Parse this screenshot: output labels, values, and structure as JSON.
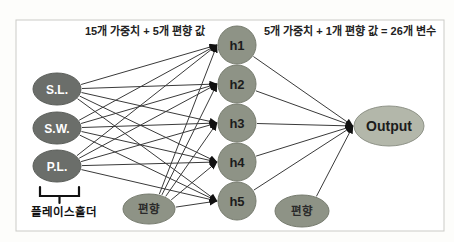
{
  "diagram": {
    "annotations": {
      "hidden_layer_note": "15개 가중치 + 5개 편향 값",
      "output_layer_note": "5개 가중치 + 1개 편향 값 = 26개 변수",
      "placeholder_label": "플레이스홀더"
    },
    "colors": {
      "input_fill": "#6b6e6a",
      "input_stroke": "#5b5e5a",
      "hidden_fill": "#8e9386",
      "hidden_stroke": "#767b6e",
      "bias_fill": "#8e9386",
      "bias_stroke": "#767b6e",
      "output_fill": "#b3b7aa",
      "output_stroke": "#8f9388",
      "edge": "#3a3a3a",
      "arrowhead": "#111111",
      "frame_border": "#cbcbc7"
    },
    "nodes": [
      {
        "id": "sl",
        "label": "S.L.",
        "type": "input",
        "x": 57,
        "y": 89,
        "rx": 24,
        "ry": 16
      },
      {
        "id": "sw",
        "label": "S.W.",
        "type": "input",
        "x": 57,
        "y": 128,
        "rx": 24,
        "ry": 16
      },
      {
        "id": "pl",
        "label": "P.L.",
        "type": "input",
        "x": 57,
        "y": 166,
        "rx": 24,
        "ry": 16
      },
      {
        "id": "h1",
        "label": "h1",
        "type": "hidden",
        "x": 237,
        "y": 45,
        "rx": 19,
        "ry": 19
      },
      {
        "id": "h2",
        "label": "h2",
        "type": "hidden",
        "x": 237,
        "y": 84,
        "rx": 19,
        "ry": 19
      },
      {
        "id": "h3",
        "label": "h3",
        "type": "hidden",
        "x": 237,
        "y": 123,
        "rx": 19,
        "ry": 19
      },
      {
        "id": "h4",
        "label": "h4",
        "type": "hidden",
        "x": 237,
        "y": 162,
        "rx": 19,
        "ry": 19
      },
      {
        "id": "h5",
        "label": "h5",
        "type": "hidden",
        "x": 237,
        "y": 201,
        "rx": 19,
        "ry": 19
      },
      {
        "id": "bias1",
        "label": "편향",
        "type": "bias",
        "x": 149,
        "y": 209,
        "rx": 26,
        "ry": 15
      },
      {
        "id": "bias2",
        "label": "편향",
        "type": "bias",
        "x": 302,
        "y": 211,
        "rx": 27,
        "ry": 16
      },
      {
        "id": "output",
        "label": "Output",
        "type": "output",
        "x": 389,
        "y": 126,
        "rx": 35,
        "ry": 20
      }
    ],
    "edges": [
      {
        "from": "sl",
        "to": "h1"
      },
      {
        "from": "sl",
        "to": "h2"
      },
      {
        "from": "sl",
        "to": "h3"
      },
      {
        "from": "sl",
        "to": "h4"
      },
      {
        "from": "sl",
        "to": "h5"
      },
      {
        "from": "sw",
        "to": "h1"
      },
      {
        "from": "sw",
        "to": "h2"
      },
      {
        "from": "sw",
        "to": "h3"
      },
      {
        "from": "sw",
        "to": "h4"
      },
      {
        "from": "sw",
        "to": "h5"
      },
      {
        "from": "pl",
        "to": "h1"
      },
      {
        "from": "pl",
        "to": "h2"
      },
      {
        "from": "pl",
        "to": "h3"
      },
      {
        "from": "pl",
        "to": "h4"
      },
      {
        "from": "pl",
        "to": "h5"
      },
      {
        "from": "bias1",
        "to": "h1"
      },
      {
        "from": "bias1",
        "to": "h2"
      },
      {
        "from": "bias1",
        "to": "h3"
      },
      {
        "from": "bias1",
        "to": "h4"
      },
      {
        "from": "bias1",
        "to": "h5"
      },
      {
        "from": "h1",
        "to": "output"
      },
      {
        "from": "h2",
        "to": "output"
      },
      {
        "from": "h3",
        "to": "output"
      },
      {
        "from": "h4",
        "to": "output"
      },
      {
        "from": "h5",
        "to": "output"
      },
      {
        "from": "bias2",
        "to": "output"
      }
    ]
  }
}
